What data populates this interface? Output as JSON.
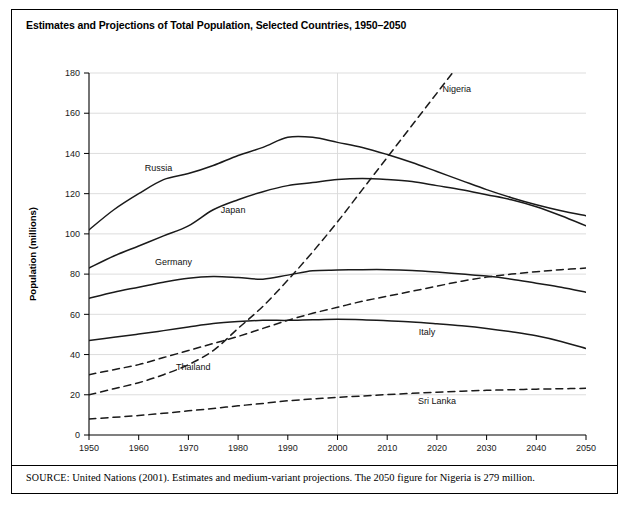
{
  "figure": {
    "title": "Estimates and Projections of Total Population, Selected Countries, 1950–2050",
    "source_label": "SOURCE:",
    "source_text": " United Nations (2001). Estimates and medium-variant projections. The 2050 figure for Nigeria is 279 million."
  },
  "chart_data": {
    "type": "line",
    "title": "Estimates and Projections of Total Population, Selected Countries, 1950–2050",
    "xlabel": "Year",
    "ylabel": "Population (millions)",
    "xlim": [
      1950,
      2050
    ],
    "ylim": [
      0,
      180
    ],
    "xticks": [
      1950,
      1960,
      1970,
      1980,
      1990,
      2000,
      2010,
      2020,
      2030,
      2040,
      2050
    ],
    "yticks": [
      0,
      20,
      40,
      60,
      80,
      100,
      120,
      140,
      160,
      180
    ],
    "grid": "horizontal",
    "legend": "inline-labels",
    "x": [
      1950,
      1955,
      1960,
      1965,
      1970,
      1975,
      1980,
      1985,
      1990,
      1995,
      2000,
      2005,
      2010,
      2015,
      2020,
      2025,
      2030,
      2035,
      2040,
      2045,
      2050
    ],
    "series": [
      {
        "name": "Russia",
        "style": "solid",
        "label_x": 1964,
        "label_y": 133,
        "values": [
          102.0,
          112.0,
          120.0,
          127.0,
          130.0,
          134.0,
          139.0,
          143.0,
          148.0,
          148.0,
          145.5,
          143.0,
          139.5,
          135.5,
          131.0,
          126.5,
          122.0,
          118.0,
          114.5,
          111.5,
          109.0
        ]
      },
      {
        "name": "Japan",
        "style": "solid",
        "label_x": 1979,
        "label_y": 112,
        "values": [
          83.0,
          89.0,
          94.0,
          99.0,
          104.0,
          112.0,
          117.0,
          121.0,
          124.0,
          125.5,
          127.0,
          127.5,
          127.0,
          126.0,
          124.0,
          122.0,
          119.5,
          117.0,
          113.5,
          109.0,
          104.0
        ]
      },
      {
        "name": "Germany",
        "style": "solid",
        "label_x": 1967,
        "label_y": 86,
        "values": [
          68.0,
          71.0,
          73.5,
          76.0,
          78.0,
          78.8,
          78.3,
          77.5,
          79.5,
          81.7,
          82.0,
          82.2,
          82.2,
          81.8,
          81.0,
          80.0,
          79.0,
          77.5,
          75.5,
          73.5,
          71.0
        ]
      },
      {
        "name": "Italy",
        "style": "solid",
        "label_x": 2018,
        "label_y": 51,
        "values": [
          47.0,
          48.6,
          50.2,
          51.9,
          53.7,
          55.4,
          56.4,
          57.0,
          57.0,
          57.3,
          57.5,
          57.3,
          56.8,
          56.2,
          55.3,
          54.3,
          53.0,
          51.3,
          49.3,
          46.5,
          43.0
        ]
      },
      {
        "name": "Nigeria",
        "style": "dashed",
        "label_x": 2024,
        "label_y": 172,
        "values": [
          20.0,
          23.0,
          26.0,
          30.0,
          35.0,
          42.0,
          53.0,
          64.0,
          77.0,
          91.0,
          106.0,
          122.0,
          138.0,
          154.0,
          170.0,
          186.0,
          202.0,
          219.0,
          238.0,
          258.0,
          279.0
        ]
      },
      {
        "name": "Thailand",
        "style": "dashed",
        "label_x": 1971,
        "label_y": 34,
        "values": [
          30.0,
          32.5,
          35.0,
          38.5,
          42.0,
          45.5,
          49.0,
          53.0,
          57.0,
          60.5,
          63.5,
          66.5,
          69.0,
          71.5,
          74.0,
          76.5,
          78.5,
          80.0,
          81.2,
          82.2,
          83.0
        ]
      },
      {
        "name": "Sri Lanka",
        "style": "dashed",
        "label_x": 2020,
        "label_y": 17,
        "values": [
          8.0,
          8.8,
          9.7,
          10.8,
          12.0,
          13.2,
          14.5,
          15.7,
          17.0,
          17.9,
          18.7,
          19.4,
          20.1,
          20.7,
          21.3,
          21.8,
          22.2,
          22.5,
          22.8,
          23.0,
          23.2
        ]
      }
    ]
  }
}
